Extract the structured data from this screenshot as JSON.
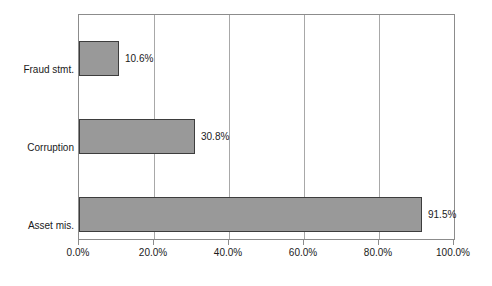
{
  "chart_data": {
    "type": "bar",
    "orientation": "horizontal",
    "title": "",
    "subtitle": "",
    "xlabel": "",
    "ylabel": "",
    "categories": [
      "Fraud stmt.",
      "Corruption",
      "Asset mis."
    ],
    "values": [
      10.6,
      30.8,
      91.5
    ],
    "value_labels": [
      "10.6%",
      "30.8%",
      "91.5%"
    ],
    "series": [
      {
        "name": "",
        "values": [
          10.6,
          30.8,
          91.5
        ]
      }
    ],
    "xlim": [
      0,
      100
    ],
    "xticks": [
      0,
      20,
      40,
      60,
      80,
      100
    ],
    "xtick_labels": [
      "0.0%",
      "20.0%",
      "40.0%",
      "60.0%",
      "80.0%",
      "100.0%"
    ],
    "grid": "vertical",
    "legend": "none",
    "bar_fill_color": "#999999",
    "bar_border_color": "#3d3d3d",
    "gridline_color": "#a8a8a8",
    "axis_color": "#8c8c8c",
    "background_color": "#ffffff"
  },
  "categories": {
    "0": {
      "label": "Fraud stmt.",
      "value_label": "10.6%"
    },
    "1": {
      "label": "Corruption",
      "value_label": "30.8%"
    },
    "2": {
      "label": "Asset mis.",
      "value_label": "91.5%"
    }
  },
  "xticks": {
    "0": {
      "label": "0.0%"
    },
    "1": {
      "label": "20.0%"
    },
    "2": {
      "label": "40.0%"
    },
    "3": {
      "label": "60.0%"
    },
    "4": {
      "label": "80.0%"
    },
    "5": {
      "label": "100.0%"
    }
  }
}
